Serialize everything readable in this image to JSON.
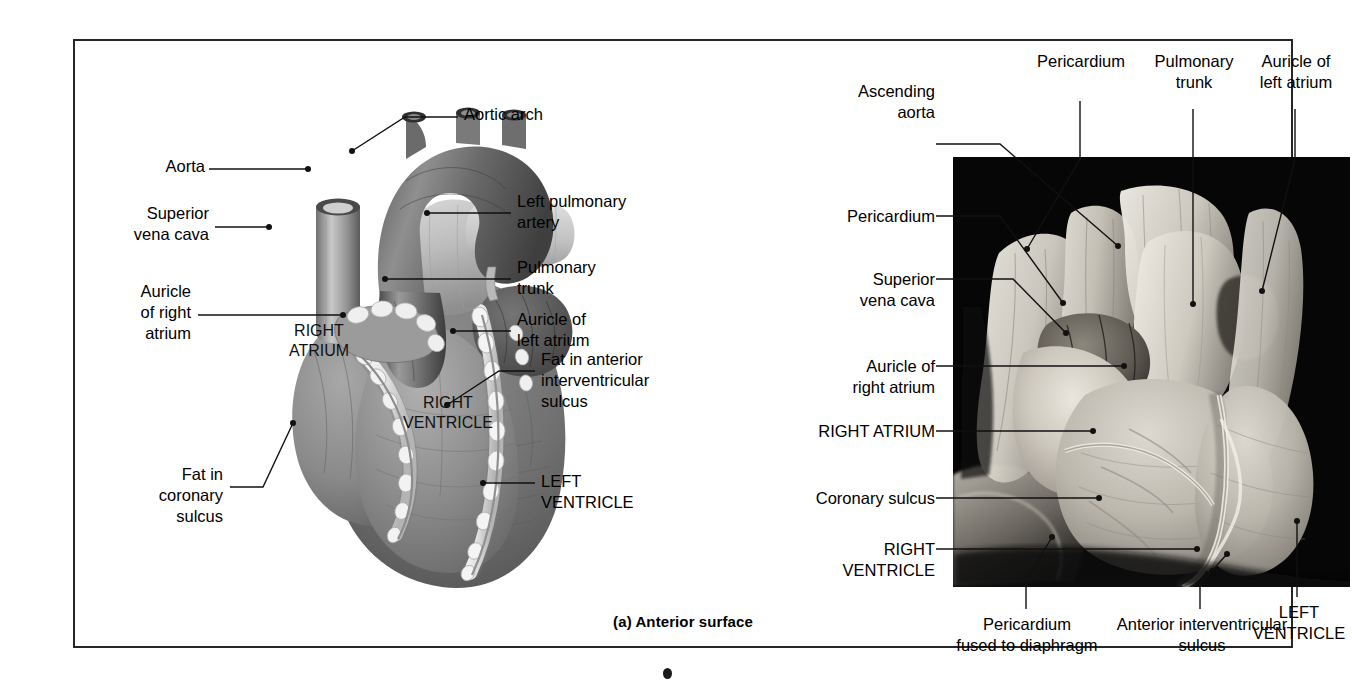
{
  "figure": {
    "caption": "(a) Anterior surface"
  },
  "illustration": {
    "name": "anterior-surface-heart-illustration",
    "labels": {
      "aortic_arch": "Aortic arch",
      "aorta": "Aorta",
      "superior_vena_cava": "Superior\nvena cava",
      "auricle_of_right_atrium": "Auricle\nof right\natrium",
      "fat_in_coronary_sulcus": "Fat in\ncoronary\nsulcus",
      "left_pulmonary_artery": "Left pulmonary\nartery",
      "pulmonary_trunk": "Pulmonary\ntrunk",
      "auricle_of_left_atrium": "Auricle of\nleft atrium",
      "fat_in_anterior_interventricular_sulcus": "Fat in anterior\ninterventricular\nsulcus",
      "left_ventricle": "LEFT\nVENTRICLE",
      "right_atrium": "RIGHT\nATRIUM",
      "right_ventricle": "RIGHT\nVENTRICLE"
    }
  },
  "photograph": {
    "name": "anterior-surface-heart-cadaver-photo",
    "labels": {
      "ascending_aorta": "Ascending\naorta",
      "pericardium_top": "Pericardium",
      "pulmonary_trunk": "Pulmonary\ntrunk",
      "auricle_of_left_atrium": "Auricle of\nleft atrium",
      "pericardium_left": "Pericardium",
      "superior_vena_cava": "Superior\nvena cava",
      "auricle_of_right_atrium": "Auricle of\nright atrium",
      "right_atrium": "RIGHT ATRIUM",
      "coronary_sulcus": "Coronary sulcus",
      "right_ventricle": "RIGHT\nVENTRICLE",
      "pericardium_fused_to_diaphragm": "Pericardium\nfused to diaphragm",
      "anterior_interventricular_sulcus": "Anterior interventricular\nsulcus",
      "left_ventricle": "LEFT\nVENTRICLE"
    }
  },
  "colors": {
    "frame": "#262626",
    "leader": "#111111",
    "photo_background": "#050505",
    "page_background": "#ffffff"
  }
}
